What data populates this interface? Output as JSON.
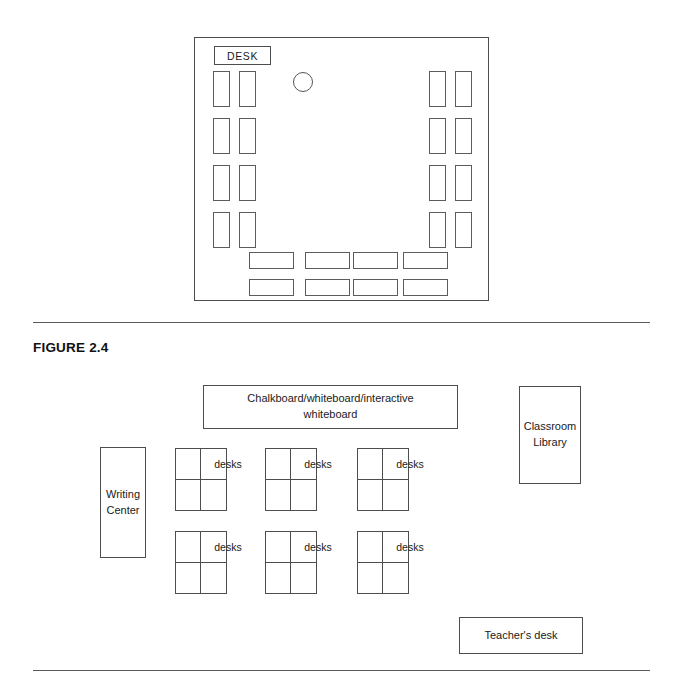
{
  "page": {
    "figure_caption": "FIGURE 2.4"
  },
  "top_diagram": {
    "name": "classroom-seating-plan-u-shape",
    "teacher_desk_label": "DESK",
    "teacher_circle": "circle-marker",
    "left_wall_desks": {
      "rows": 4,
      "cols": 2,
      "orientation": "vertical"
    },
    "right_wall_desks": {
      "rows": 4,
      "cols": 2,
      "orientation": "vertical"
    },
    "bottom_desks": {
      "rows": 2,
      "cols": 4,
      "orientation": "horizontal"
    }
  },
  "bottom_diagram": {
    "name": "classroom-layout-plan",
    "board_label": "Chalkboard/whiteboard/interactive whiteboard",
    "board_line1": "Chalkboard/whiteboard/interactive",
    "board_line2": "whiteboard",
    "library_line1": "Classroom",
    "library_line2": "Library",
    "writing_line1": "Writing",
    "writing_line2": "Center",
    "teacher_desk_label": "Teacher's desk",
    "desk_groups": [
      {
        "label": "desks"
      },
      {
        "label": "desks"
      },
      {
        "label": "desks"
      },
      {
        "label": "desks"
      },
      {
        "label": "desks"
      },
      {
        "label": "desks"
      }
    ]
  },
  "colors": {
    "stroke": "#4d4d4d",
    "rule": "#5a5a5a",
    "text": "#1a1a1a",
    "background": "#ffffff"
  }
}
